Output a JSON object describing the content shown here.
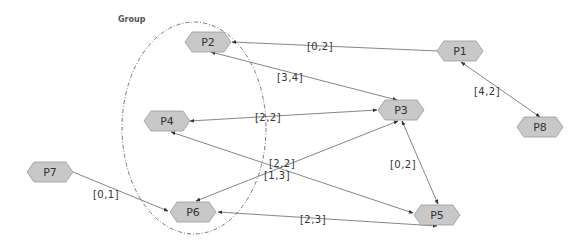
{
  "diagram": {
    "group": {
      "label": "Group",
      "members": [
        "P2",
        "P4",
        "P6"
      ],
      "shape": {
        "cx": 194,
        "cy": 128,
        "rx": 72,
        "ry": 106
      },
      "label_pos": {
        "x": 118,
        "y": 22
      }
    },
    "colors": {
      "node_fill": "#c8c8c8",
      "node_stroke": "#999999",
      "edge": "#666666",
      "text": "#333333"
    },
    "nodes": [
      {
        "id": "P1",
        "label": "P1",
        "x": 460,
        "y": 51
      },
      {
        "id": "P2",
        "label": "P2",
        "x": 208,
        "y": 42
      },
      {
        "id": "P3",
        "label": "P3",
        "x": 401,
        "y": 110
      },
      {
        "id": "P4",
        "label": "P4",
        "x": 167,
        "y": 121
      },
      {
        "id": "P5",
        "label": "P5",
        "x": 437,
        "y": 215
      },
      {
        "id": "P6",
        "label": "P6",
        "x": 193,
        "y": 212
      },
      {
        "id": "P7",
        "label": "P7",
        "x": 50,
        "y": 172
      },
      {
        "id": "P8",
        "label": "P8",
        "x": 540,
        "y": 127
      }
    ],
    "edges": [
      {
        "from": "P1",
        "to": "P2",
        "label": "[0,2]",
        "arrow_start": false,
        "arrow_end": true,
        "x1": 438,
        "y1": 51,
        "x2": 232,
        "y2": 42,
        "lx": 320,
        "ly": 47
      },
      {
        "from": "P1",
        "to": "P8",
        "label": "[4,2]",
        "arrow_start": true,
        "arrow_end": true,
        "x1": 461,
        "y1": 62,
        "x2": 540,
        "y2": 117,
        "lx": 487,
        "ly": 92
      },
      {
        "from": "P2",
        "to": "P3",
        "label": "[3,4]",
        "arrow_start": true,
        "arrow_end": true,
        "x1": 211,
        "y1": 52,
        "x2": 397,
        "y2": 100,
        "lx": 290,
        "ly": 78
      },
      {
        "from": "P3",
        "to": "P4",
        "label": "[2,2]",
        "arrow_start": true,
        "arrow_end": true,
        "x1": 377,
        "y1": 110,
        "x2": 190,
        "y2": 121,
        "lx": 268,
        "ly": 118
      },
      {
        "from": "P3",
        "to": "P6",
        "label": "[2,2]",
        "arrow_start": true,
        "arrow_end": true,
        "x1": 398,
        "y1": 121,
        "x2": 196,
        "y2": 201,
        "lx": 282,
        "ly": 164
      },
      {
        "from": "P4",
        "to": "P5",
        "label": "[1,3]",
        "arrow_start": true,
        "arrow_end": true,
        "x1": 171,
        "y1": 132,
        "x2": 413,
        "y2": 213,
        "lx": 277,
        "ly": 176
      },
      {
        "from": "P3",
        "to": "P5",
        "label": "[0,2]",
        "arrow_start": true,
        "arrow_end": true,
        "x1": 402,
        "y1": 121,
        "x2": 438,
        "y2": 204,
        "lx": 403,
        "ly": 165
      },
      {
        "from": "P7",
        "to": "P6",
        "label": "[0,1]",
        "arrow_start": false,
        "arrow_end": true,
        "x1": 73,
        "y1": 172,
        "x2": 168,
        "y2": 211,
        "lx": 106,
        "ly": 195
      },
      {
        "from": "P6",
        "to": "P5",
        "label": "[2,3]",
        "arrow_start": true,
        "arrow_end": true,
        "x1": 218,
        "y1": 212,
        "x2": 437,
        "y2": 226,
        "lx": 313,
        "ly": 220
      }
    ]
  }
}
